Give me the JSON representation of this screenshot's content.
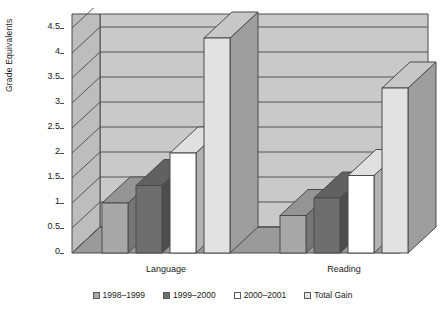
{
  "chart_data": {
    "type": "bar",
    "title": "",
    "xlabel": "",
    "ylabel": "Grade Equivalents",
    "categories": [
      "Language",
      "Reading"
    ],
    "series": [
      {
        "name": "1998–1999",
        "color": "#a8a8a8",
        "values": [
          1.0,
          0.75
        ]
      },
      {
        "name": "1999–2000",
        "color": "#6e6e6e",
        "values": [
          1.35,
          1.1
        ]
      },
      {
        "name": "2000–2001",
        "color": "#ffffff",
        "values": [
          2.0,
          1.55
        ]
      },
      {
        "name": "Total Gain",
        "color": "#e2e2e2",
        "values": [
          4.3,
          3.3
        ]
      }
    ],
    "ylim": [
      0,
      4.5
    ],
    "yticks": [
      "0",
      "0.5",
      "1",
      "1.5",
      "2",
      "2.5",
      "3",
      "3.5",
      "4",
      "4.5"
    ],
    "ytick_values": [
      0,
      0.5,
      1,
      1.5,
      2,
      2.5,
      3,
      3.5,
      4,
      4.5
    ],
    "grid": true,
    "legend_position": "bottom",
    "style": "3d-column"
  },
  "colors": {
    "wall": "#c9c9c9",
    "wall_top": "#bdbdbd",
    "floor": "#9a9a9a",
    "gridline": "#555555",
    "outline": "#4a4a4a",
    "text": "#1a1a1a",
    "background": "#ffffff"
  },
  "axis": {
    "y_title": "Grade Equivalents"
  }
}
